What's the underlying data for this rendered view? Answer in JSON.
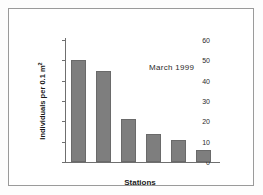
{
  "chart_data": {
    "type": "bar",
    "title": "",
    "subtitle": "",
    "xlabel": "Stations",
    "ylabel": "Individuals per 0.1 m",
    "ylabel_superscript": "2",
    "categories": [
      "1",
      "2",
      "3",
      "4",
      "5",
      "7"
    ],
    "values": [
      50,
      45,
      21,
      14,
      11,
      6
    ],
    "ylim": [
      0,
      60
    ],
    "yticks": [
      0,
      10,
      20,
      30,
      40,
      50,
      60
    ],
    "ytick_labels": [
      "0",
      "10",
      "20",
      "30",
      "40",
      "50",
      "60"
    ],
    "grid": false,
    "legend": false,
    "legend_position": "none",
    "annotations": [
      {
        "text": "March 1999",
        "x": "upper-right"
      }
    ],
    "bar_color": "#7e7e7e",
    "bar_edge_color": "#6a6a6a",
    "axis_color": "#6f6f6f",
    "background_color": "#ffffff",
    "frame_color": "#9a9a9a"
  }
}
